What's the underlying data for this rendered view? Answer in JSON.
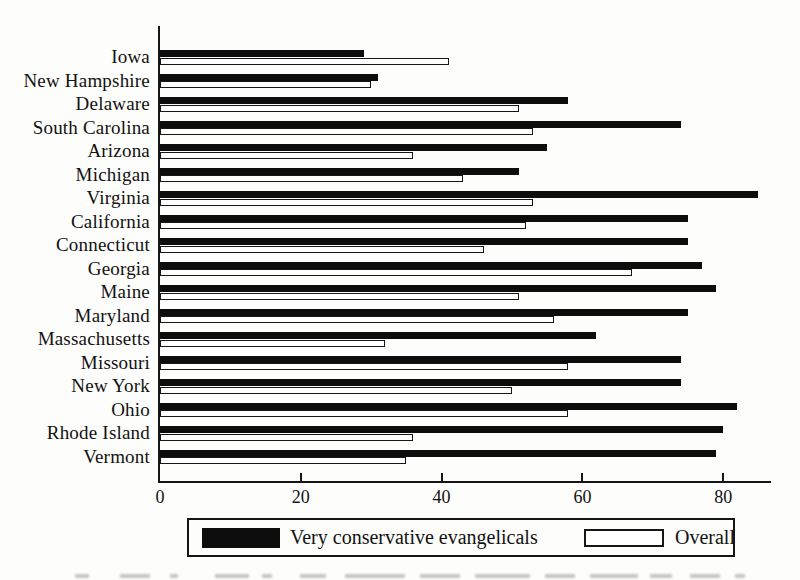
{
  "figure": {
    "background": "#fdfdfb",
    "ink": "#161616"
  },
  "chart_data": {
    "type": "bar",
    "orientation": "horizontal",
    "title": "",
    "xlabel": "",
    "ylabel": "",
    "grid": false,
    "legend_position": "bottom",
    "xlim": [
      0,
      87
    ],
    "x_ticks": [
      0,
      20,
      40,
      60,
      80
    ],
    "categories": [
      "Iowa",
      "New Hampshire",
      "Delaware",
      "South Carolina",
      "Arizona",
      "Michigan",
      "Virginia",
      "California",
      "Connecticut",
      "Georgia",
      "Maine",
      "Maryland",
      "Massachusetts",
      "Missouri",
      "New York",
      "Ohio",
      "Rhode Island",
      "Vermont"
    ],
    "series": [
      {
        "name": "Very conservative evangelicals",
        "style": "solid-black",
        "color": "#0d0d0d",
        "values": [
          29,
          31,
          58,
          74,
          55,
          51,
          85,
          75,
          75,
          77,
          79,
          75,
          62,
          74,
          74,
          82,
          80,
          79
        ]
      },
      {
        "name": "Overall",
        "style": "white-outlined",
        "color": "#ffffff",
        "values": [
          41,
          30,
          51,
          53,
          36,
          43,
          53,
          52,
          46,
          67,
          51,
          56,
          32,
          58,
          50,
          58,
          36,
          35
        ]
      }
    ]
  }
}
